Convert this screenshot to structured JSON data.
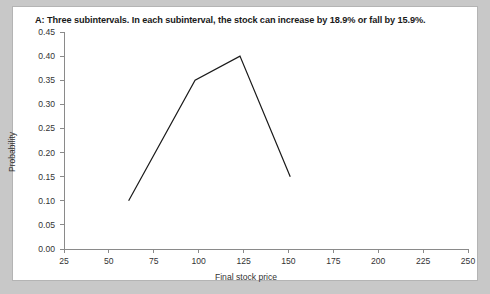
{
  "chart_data": {
    "type": "line",
    "title": "A: Three subintervals. In each subinterval, the stock can increase by 18.9% or fall by 15.9%.",
    "xlabel": "Final stock price",
    "ylabel": "Probability",
    "x": [
      61,
      98,
      123,
      151
    ],
    "values": [
      0.1,
      0.35,
      0.4,
      0.15
    ],
    "series": [
      {
        "name": "Probability",
        "values": [
          0.1,
          0.35,
          0.4,
          0.15
        ]
      }
    ],
    "xlim": [
      25,
      250
    ],
    "ylim": [
      0.0,
      0.45
    ],
    "xticks": [
      25,
      50,
      75,
      100,
      125,
      150,
      175,
      200,
      225,
      250
    ],
    "xtick_labels": [
      "25",
      "50",
      "75",
      "100",
      "125",
      "150",
      "175",
      "200",
      "225",
      "250"
    ],
    "yticks": [
      0.0,
      0.05,
      0.1,
      0.15,
      0.2,
      0.25,
      0.3,
      0.35,
      0.4,
      0.45
    ],
    "ytick_labels": [
      "0.00",
      "0.05",
      "0.10",
      "0.15",
      "0.20",
      "0.25",
      "0.30",
      "0.35",
      "0.40",
      "0.45"
    ],
    "grid": false,
    "legend": null,
    "line_color": "#1a1a1a",
    "line_width": 1.2,
    "background": "#ffffff"
  }
}
